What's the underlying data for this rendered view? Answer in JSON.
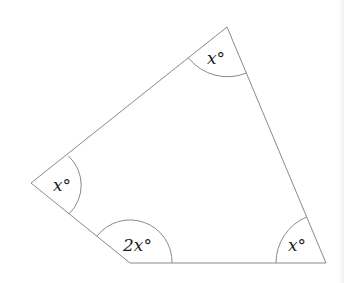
{
  "diagram": {
    "type": "quadrilateral",
    "stroke_color": "#8a8a8a",
    "text_color": "#231f20",
    "vertices": [
      {
        "id": "top",
        "x": 227,
        "y": 27,
        "angle_label": "x°",
        "arc_radius": 50,
        "label_x": 205,
        "label_y": 64
      },
      {
        "id": "left",
        "x": 31,
        "y": 183,
        "angle_label": "x°",
        "arc_radius": 40,
        "label_x": 53,
        "label_y": 191
      },
      {
        "id": "bottom-left",
        "x": 130,
        "y": 263,
        "angle_label": "2x°",
        "arc_radius": 42,
        "label_x": 122,
        "label_y": 251
      },
      {
        "id": "bottom-right",
        "x": 326,
        "y": 263,
        "angle_label": "x°",
        "arc_radius": 50,
        "label_x": 286,
        "label_y": 251
      }
    ],
    "labels": {
      "top": "x°",
      "left": "x°",
      "bottom_left": "2x°",
      "bottom_right": "x°"
    }
  }
}
